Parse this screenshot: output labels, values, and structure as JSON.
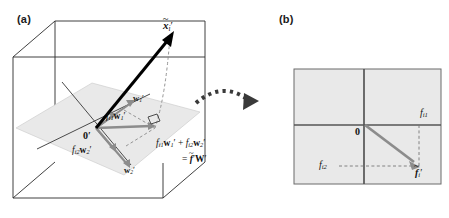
{
  "figure": {
    "type": "diagram",
    "width": 449,
    "height": 218
  },
  "panels": {
    "a": {
      "label": "(a)",
      "vector_data_tilde": {
        "base": "x",
        "style": "bold-italic",
        "tilde": true,
        "subscript": "i",
        "prime": true,
        "display": "x̃i′"
      },
      "origin": {
        "base": "0",
        "style": "bold",
        "prime": true,
        "display": "0′"
      },
      "basis_vector_1": {
        "base": "w",
        "style": "bold",
        "subscript": "1",
        "prime": true,
        "display": "w1′"
      },
      "basis_vector_2": {
        "base": "w",
        "style": "bold",
        "subscript": "2",
        "prime": true,
        "display": "w2′"
      },
      "component_1": {
        "coefficient": "f",
        "coefficient_subscript": "i1",
        "vector": "w",
        "vector_subscript": "1",
        "prime": true,
        "display": "fi1w1′"
      },
      "component_2": {
        "coefficient": "f",
        "coefficient_subscript": "i2",
        "vector": "w",
        "vector_subscript": "2",
        "prime": true,
        "display": "fi2w2′"
      },
      "equation_line_1": "fi1w1′ + fi2w2′",
      "equation_line_2": "= f̃i′ W′",
      "right_angle_marker": true,
      "shaded_plane_fill": "#e9e9e9",
      "cube_line_color": "#2b2b2b",
      "gray_vector_color": "#8c8c8c",
      "black_vector_color": "#000000"
    },
    "b": {
      "label": "(b)",
      "origin_label": "0",
      "axis_label_vertical": {
        "coefficient": "f",
        "subscript": "i1",
        "display": "fi1"
      },
      "axis_label_horizontal": {
        "coefficient": "f",
        "subscript": "i2",
        "display": "fi2"
      },
      "score_vector": {
        "base": "f",
        "style": "bold-italic",
        "tilde": true,
        "subscript": "i",
        "prime": true,
        "display": "f̃i′"
      },
      "plane_fill": "#e9e9e9",
      "axis_color": "#555555",
      "border_color": "#6b6b6b",
      "vector_color": "#8c8c8c",
      "dashed_guide_color": "#777777"
    }
  },
  "transition_arrow": {
    "name": "curved-dotted-arrow",
    "style": "dotted-square-dashes-with-triangular-arrowhead",
    "color": "#3a3a3a",
    "direction": "left-to-right-downward"
  }
}
